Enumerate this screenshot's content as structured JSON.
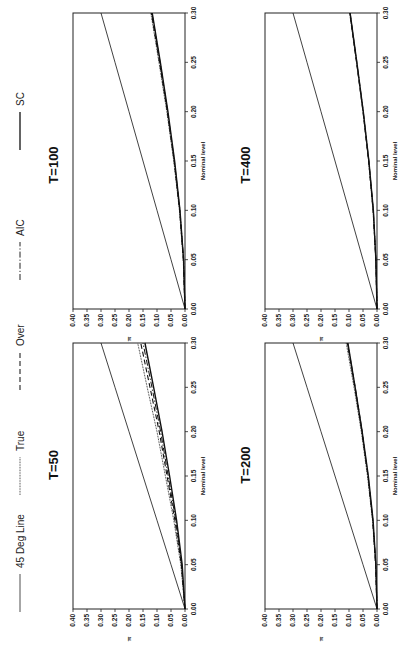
{
  "legend": {
    "items": [
      {
        "label": "45 Deg Line",
        "style": "thin-solid"
      },
      {
        "label": "True",
        "style": "fine-dotted"
      },
      {
        "label": "Over",
        "style": "dashed"
      },
      {
        "label": "AIC",
        "style": "dot-dash"
      },
      {
        "label": "SC",
        "style": "thick-solid"
      }
    ]
  },
  "chart_data": [
    {
      "type": "line",
      "title": "T=50",
      "xlabel": "Nominal level",
      "ylabel": "π",
      "xlim": [
        0.0,
        0.3
      ],
      "ylim": [
        0.0,
        0.4
      ],
      "xticks": [
        "0.00",
        "0.05",
        "0.10",
        "0.15",
        "0.20",
        "0.25",
        "0.30"
      ],
      "yticks": [
        "0.00",
        "0.05",
        "0.10",
        "0.15",
        "0.20",
        "0.25",
        "0.30",
        "0.35",
        "0.40"
      ],
      "x": [
        0.0,
        0.05,
        0.1,
        0.15,
        0.2,
        0.25,
        0.3
      ],
      "series": [
        {
          "name": "45 Deg Line",
          "values": [
            0.0,
            0.05,
            0.1,
            0.15,
            0.2,
            0.25,
            0.3
          ]
        },
        {
          "name": "True",
          "values": [
            0.0,
            0.015,
            0.04,
            0.07,
            0.1,
            0.135,
            0.169
          ]
        },
        {
          "name": "Over",
          "values": [
            0.0,
            0.013,
            0.036,
            0.064,
            0.092,
            0.125,
            0.158
          ]
        },
        {
          "name": "AIC",
          "values": [
            0.0,
            0.012,
            0.033,
            0.06,
            0.087,
            0.118,
            0.15
          ]
        },
        {
          "name": "SC",
          "values": [
            0.0,
            0.01,
            0.03,
            0.055,
            0.082,
            0.112,
            0.143
          ]
        }
      ]
    },
    {
      "type": "line",
      "title": "T=100",
      "xlabel": "Nominal level",
      "ylabel": "π",
      "xlim": [
        0.0,
        0.3
      ],
      "ylim": [
        0.0,
        0.4
      ],
      "xticks": [
        "0.00",
        "0.05",
        "0.10",
        "0.15",
        "0.20",
        "0.25",
        "0.30"
      ],
      "yticks": [
        "0.00",
        "0.05",
        "0.10",
        "0.15",
        "0.20",
        "0.25",
        "0.30",
        "0.35",
        "0.40"
      ],
      "x": [
        0.0,
        0.05,
        0.1,
        0.15,
        0.2,
        0.25,
        0.3
      ],
      "series": [
        {
          "name": "45 Deg Line",
          "values": [
            0.0,
            0.05,
            0.1,
            0.15,
            0.2,
            0.25,
            0.3
          ]
        },
        {
          "name": "True",
          "values": [
            0.0,
            0.006,
            0.02,
            0.04,
            0.065,
            0.093,
            0.122
          ]
        },
        {
          "name": "Over",
          "values": [
            0.0,
            0.006,
            0.019,
            0.039,
            0.063,
            0.091,
            0.12
          ]
        },
        {
          "name": "AIC",
          "values": [
            0.0,
            0.005,
            0.018,
            0.038,
            0.062,
            0.089,
            0.118
          ]
        },
        {
          "name": "SC",
          "values": [
            0.0,
            0.005,
            0.018,
            0.037,
            0.061,
            0.088,
            0.117
          ]
        }
      ]
    },
    {
      "type": "line",
      "title": "T=200",
      "xlabel": "Nominal level",
      "ylabel": "π",
      "xlim": [
        0.0,
        0.3
      ],
      "ylim": [
        0.0,
        0.4
      ],
      "xticks": [
        "0.00",
        "0.05",
        "0.10",
        "0.15",
        "0.20",
        "0.25",
        "0.30"
      ],
      "yticks": [
        "0.00",
        "0.05",
        "0.10",
        "0.15",
        "0.20",
        "0.25",
        "0.30",
        "0.35",
        "0.40"
      ],
      "x": [
        0.0,
        0.05,
        0.1,
        0.15,
        0.2,
        0.25,
        0.3
      ],
      "series": [
        {
          "name": "45 Deg Line",
          "values": [
            0.0,
            0.05,
            0.1,
            0.15,
            0.2,
            0.25,
            0.3
          ]
        },
        {
          "name": "True",
          "values": [
            0.0,
            0.005,
            0.016,
            0.034,
            0.056,
            0.082,
            0.11
          ]
        },
        {
          "name": "Over",
          "values": [
            0.0,
            0.005,
            0.015,
            0.032,
            0.053,
            0.078,
            0.105
          ]
        },
        {
          "name": "AIC",
          "values": [
            0.0,
            0.004,
            0.015,
            0.032,
            0.054,
            0.079,
            0.106
          ]
        },
        {
          "name": "SC",
          "values": [
            0.0,
            0.004,
            0.014,
            0.031,
            0.053,
            0.078,
            0.104
          ]
        }
      ]
    },
    {
      "type": "line",
      "title": "T=400",
      "xlabel": "Nominal level",
      "ylabel": "π",
      "xlim": [
        0.0,
        0.3
      ],
      "ylim": [
        0.0,
        0.4
      ],
      "xticks": [
        "0.00",
        "0.05",
        "0.10",
        "0.15",
        "0.20",
        "0.25",
        "0.30"
      ],
      "yticks": [
        "0.00",
        "0.05",
        "0.10",
        "0.15",
        "0.20",
        "0.25",
        "0.30",
        "0.35",
        "0.40"
      ],
      "x": [
        0.0,
        0.05,
        0.1,
        0.15,
        0.2,
        0.25,
        0.3
      ],
      "series": [
        {
          "name": "45 Deg Line",
          "values": [
            0.0,
            0.05,
            0.1,
            0.15,
            0.2,
            0.25,
            0.3
          ]
        },
        {
          "name": "True",
          "values": [
            0.0,
            0.004,
            0.014,
            0.03,
            0.05,
            0.073,
            0.098
          ]
        },
        {
          "name": "Over",
          "values": [
            0.0,
            0.004,
            0.014,
            0.03,
            0.05,
            0.073,
            0.097
          ]
        },
        {
          "name": "AIC",
          "values": [
            0.0,
            0.004,
            0.013,
            0.029,
            0.049,
            0.072,
            0.096
          ]
        },
        {
          "name": "SC",
          "values": [
            0.0,
            0.004,
            0.013,
            0.029,
            0.049,
            0.072,
            0.096
          ]
        }
      ]
    }
  ]
}
